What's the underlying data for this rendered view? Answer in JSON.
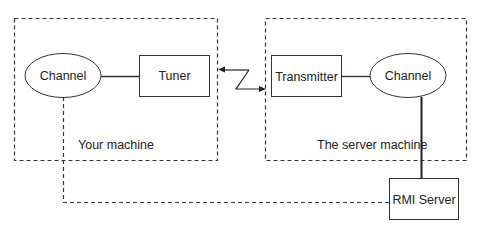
{
  "diagram": {
    "groups": [
      {
        "id": "your-machine",
        "label": "Your machine"
      },
      {
        "id": "server-machine",
        "label": "The server machine"
      }
    ],
    "nodes": {
      "client_channel": {
        "label": "Channel",
        "shape": "ellipse"
      },
      "tuner": {
        "label": "Tuner",
        "shape": "rect"
      },
      "transmitter": {
        "label": "Transmitter",
        "shape": "rect"
      },
      "server_channel": {
        "label": "Channel",
        "shape": "ellipse"
      },
      "rmi_server": {
        "label": "RMI Server",
        "shape": "rect"
      }
    },
    "edges": [
      {
        "from": "client_channel",
        "to": "tuner",
        "style": "solid"
      },
      {
        "from": "tuner",
        "to": "transmitter",
        "style": "lightning-bidirectional"
      },
      {
        "from": "transmitter",
        "to": "server_channel",
        "style": "solid"
      },
      {
        "from": "server_channel",
        "to": "rmi_server",
        "style": "solid-thick"
      },
      {
        "from": "client_channel",
        "to": "rmi_server",
        "style": "dashed"
      }
    ],
    "colors": {
      "stroke": "#333333",
      "text": "#222222",
      "background": "#ffffff"
    }
  }
}
